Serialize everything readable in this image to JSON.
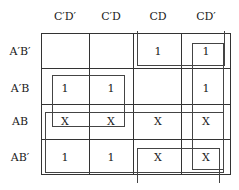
{
  "kmap": {
    "col_headers": [
      "C′D′",
      "C′D",
      "CD",
      "CD′"
    ],
    "row_headers": [
      "A′B′",
      "A′B",
      "AB",
      "AB′"
    ],
    "cells": [
      [
        "",
        "",
        "1",
        "1"
      ],
      [
        "1",
        "1",
        "",
        "1"
      ],
      [
        "X",
        "X",
        "X",
        "X"
      ],
      [
        "1",
        "1",
        "X",
        "X"
      ]
    ]
  }
}
